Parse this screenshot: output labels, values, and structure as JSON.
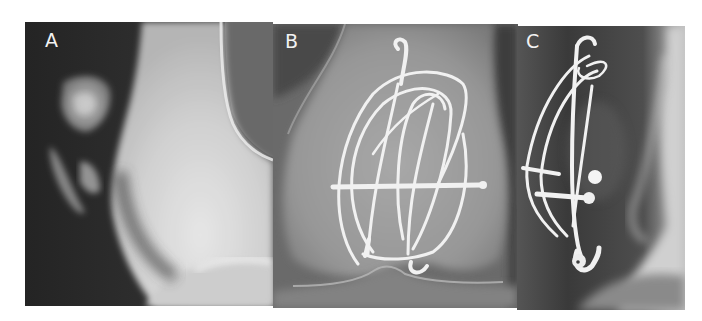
{
  "figure": {
    "panels": [
      {
        "id": "A",
        "label": "A",
        "view": "lateral radiograph",
        "description": "Knee with detached osteochondral fragments anterior to femoral condyle"
      },
      {
        "id": "B",
        "label": "B",
        "view": "anteroposterior radiograph",
        "description": "Distal femur with wire cerclage and transverse screw fixation"
      },
      {
        "id": "C",
        "label": "C",
        "view": "lateral radiograph",
        "description": "Wire loops and screw heads fixing fragment, hooked wire end at bottom"
      }
    ],
    "colors": {
      "background": "#ffffff",
      "label": "#f2f2f2",
      "bone": "#e6e6e6",
      "hardware": "#f4f4f4",
      "soft_tissue_dark": "#2c2c2c"
    }
  }
}
